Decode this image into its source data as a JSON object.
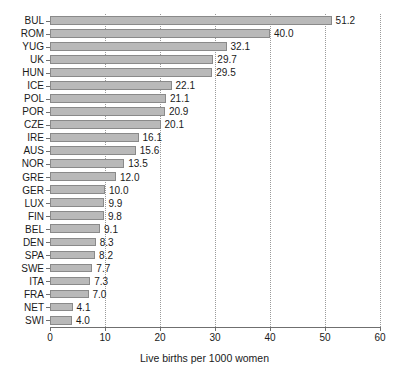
{
  "chart_data": {
    "type": "bar",
    "orientation": "horizontal",
    "title": "",
    "xlabel": "Live births per 1000 women",
    "ylabel": "",
    "xlim": [
      0,
      60
    ],
    "xticks": [
      0,
      10,
      20,
      30,
      40,
      50,
      60
    ],
    "xtick_labels": [
      "0",
      "10",
      "20",
      "30",
      "40",
      "50",
      "60"
    ],
    "grid": "vertical-dotted",
    "legend": "none",
    "bar_fill": "#b9b9b9",
    "bar_edge": "#8a8a8a",
    "axis_color": "#6f6f6f",
    "categories": [
      "BUL",
      "ROM",
      "YUG",
      "UK",
      "HUN",
      "ICE",
      "POL",
      "POR",
      "CZE",
      "IRE",
      "AUS",
      "NOR",
      "GRE",
      "GER",
      "LUX",
      "FIN",
      "BEL",
      "DEN",
      "SPA",
      "SWE",
      "ITA",
      "FRA",
      "NET",
      "SWI"
    ],
    "values": [
      51.2,
      40.0,
      32.1,
      29.7,
      29.5,
      22.1,
      21.1,
      20.9,
      20.1,
      16.1,
      15.6,
      13.5,
      12.0,
      10.0,
      9.9,
      9.8,
      9.1,
      8.3,
      8.2,
      7.7,
      7.3,
      7.0,
      4.1,
      4.0
    ],
    "value_labels": [
      "51.2",
      "40.0",
      "32.1",
      "29.7",
      "29.5",
      "22.1",
      "21.1",
      "20.9",
      "20.1",
      "16.1",
      "15.6",
      "13.5",
      "12.0",
      "10.0",
      "9.9",
      "9.8",
      "9.1",
      "8.3",
      "8.2",
      "7.7",
      "7.3",
      "7.0",
      "4.1",
      "4.0"
    ]
  }
}
